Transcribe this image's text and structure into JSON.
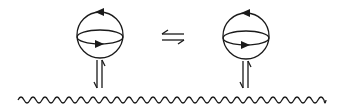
{
  "diagram": {
    "type": "feynman-like",
    "background": "#ffffff",
    "stroke_color": "#1a1a1a",
    "left_loop": {
      "cx": 100,
      "cy": 35,
      "r": 23,
      "equator_ry": 7,
      "top_arrow": "left",
      "equator_arrow": "right",
      "coupling": "harpoons-down-up"
    },
    "right_loop": {
      "cx": 246,
      "cy": 36,
      "r": 23,
      "equator_ry": 7,
      "top_arrow": "left",
      "equator_arrow": "right",
      "coupling": "harpoons-down-up"
    },
    "relation_symbol": "⇋",
    "wavy_line": {
      "x_start": 18,
      "x_end": 326,
      "y": 100,
      "amplitude": 3,
      "wavelength": 12
    }
  }
}
